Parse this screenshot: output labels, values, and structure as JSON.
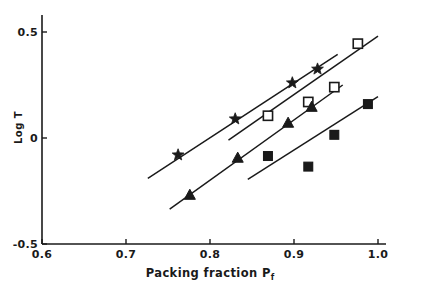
{
  "chart_data": {
    "type": "scatter",
    "title": "",
    "xlabel": "Packing fraction Pf",
    "xlabel_main": "Packing fraction P",
    "xlabel_sub": "f",
    "ylabel": "Log T",
    "xlim": [
      0.6,
      1.0
    ],
    "ylim": [
      -0.5,
      0.5
    ],
    "xticks": [
      0.6,
      0.7,
      0.8,
      0.9,
      1.0
    ],
    "xtick_labels": [
      "0.6",
      "0.7",
      "0.8",
      "0.9",
      "1.0"
    ],
    "yticks": [
      0.5,
      0.0,
      -0.5
    ],
    "ytick_labels": [
      "0.5",
      "0",
      "-0.5"
    ],
    "grid": false,
    "legend_position": "none",
    "marker_color": "#1a1a1a",
    "line_color": "#1a1a1a",
    "series": [
      {
        "name": "star-series",
        "marker": "filled-star",
        "points": [
          {
            "x": 0.762,
            "y": -0.08
          },
          {
            "x": 0.83,
            "y": 0.09
          },
          {
            "x": 0.898,
            "y": 0.26
          },
          {
            "x": 0.928,
            "y": 0.325
          }
        ],
        "fit_line": {
          "x0": 0.726,
          "y0": -0.19,
          "x1": 0.952,
          "y1": 0.395
        }
      },
      {
        "name": "open-square-series",
        "marker": "open-square",
        "points": [
          {
            "x": 0.869,
            "y": 0.105
          },
          {
            "x": 0.917,
            "y": 0.17
          },
          {
            "x": 0.948,
            "y": 0.24
          },
          {
            "x": 0.976,
            "y": 0.445
          }
        ],
        "fit_line": {
          "x0": 0.822,
          "y0": -0.01,
          "x1": 1.0,
          "y1": 0.48
        }
      },
      {
        "name": "filled-triangle-series",
        "marker": "filled-triangle",
        "points": [
          {
            "x": 0.776,
            "y": -0.27
          },
          {
            "x": 0.833,
            "y": -0.095
          },
          {
            "x": 0.893,
            "y": 0.07
          },
          {
            "x": 0.921,
            "y": 0.145
          }
        ],
        "fit_line": {
          "x0": 0.752,
          "y0": -0.335,
          "x1": 0.958,
          "y1": 0.25
        }
      },
      {
        "name": "filled-square-series",
        "marker": "filled-square",
        "points": [
          {
            "x": 0.869,
            "y": -0.085
          },
          {
            "x": 0.917,
            "y": -0.135
          },
          {
            "x": 0.948,
            "y": 0.015
          },
          {
            "x": 0.988,
            "y": 0.16
          }
        ],
        "fit_line": {
          "x0": 0.845,
          "y0": -0.195,
          "x1": 1.0,
          "y1": 0.195
        }
      }
    ]
  }
}
